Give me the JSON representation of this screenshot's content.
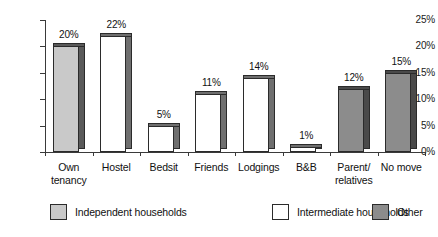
{
  "chart_data": {
    "type": "bar",
    "title": "",
    "subtitle": "",
    "xlabel": "",
    "ylabel": "",
    "ylim": [
      0,
      25
    ],
    "y_ticks": [
      "0%",
      "5%",
      "10%",
      "15%",
      "20%",
      "25%"
    ],
    "y_tick_values": [
      0,
      5,
      10,
      15,
      20,
      25
    ],
    "grid": false,
    "legend_position": "bottom",
    "categories": [
      "Own tenancy",
      "Hostel",
      "Bedsit",
      "Friends",
      "Lodgings",
      "B&B",
      "Parent/ relatives",
      "No move"
    ],
    "category_lines": [
      [
        "Own",
        "tenancy"
      ],
      [
        "Hostel",
        ""
      ],
      [
        "Bedsit",
        ""
      ],
      [
        "Friends",
        ""
      ],
      [
        "Lodgings",
        ""
      ],
      [
        "B&B",
        ""
      ],
      [
        "Parent/",
        "relatives"
      ],
      [
        "No move",
        ""
      ]
    ],
    "values": [
      20,
      22,
      5,
      11,
      14,
      1,
      12,
      15
    ],
    "value_labels": [
      "20%",
      "22%",
      "5%",
      "11%",
      "14%",
      "1%",
      "12%",
      "15%"
    ],
    "point_groups": [
      "Independent households",
      "Intermediate households",
      "Intermediate households",
      "Intermediate households",
      "Intermediate households",
      "Intermediate households",
      "Other",
      "Other"
    ],
    "series": [
      {
        "name": "Independent households",
        "color": "#c9c9c9",
        "points": [
          {
            "category": "Own tenancy",
            "value": 20,
            "label": "20%"
          }
        ]
      },
      {
        "name": "Intermediate households",
        "color": "#ffffff",
        "points": [
          {
            "category": "Hostel",
            "value": 22,
            "label": "22%"
          },
          {
            "category": "Bedsit",
            "value": 5,
            "label": "5%"
          },
          {
            "category": "Friends",
            "value": 11,
            "label": "11%"
          },
          {
            "category": "Lodgings",
            "value": 14,
            "label": "14%"
          },
          {
            "category": "B&B",
            "value": 1,
            "label": "1%"
          }
        ]
      },
      {
        "name": "Other",
        "color": "#8c8c8c",
        "points": [
          {
            "category": "Parent/ relatives",
            "value": 12,
            "label": "12%"
          },
          {
            "category": "No move",
            "value": 15,
            "label": "15%"
          }
        ]
      }
    ]
  },
  "legend": {
    "items": [
      {
        "label": "Independent households",
        "color": "#c9c9c9"
      },
      {
        "label": "Intermediate households",
        "color": "#ffffff"
      },
      {
        "label": "Other",
        "color": "#8c8c8c"
      }
    ]
  },
  "colors": {
    "independent": "#c9c9c9",
    "intermediate": "#ffffff",
    "other": "#8c8c8c",
    "side_independent": "#5a5a5a",
    "side_intermediate": "#6f6f6f",
    "side_other": "#4a4a4a",
    "axis": "#3a3a3a",
    "text": "#111111",
    "background": "#ffffff"
  }
}
